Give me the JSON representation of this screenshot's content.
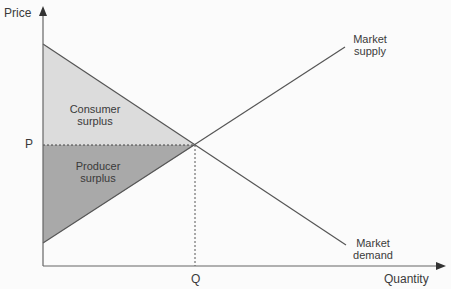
{
  "diagram": {
    "axes": {
      "y_label": "Price",
      "x_label": "Quantity"
    },
    "equilibrium": {
      "price_label": "P",
      "quantity_label": "Q"
    },
    "curves": {
      "supply": {
        "label_line1": "Market",
        "label_line2": "supply"
      },
      "demand": {
        "label_line1": "Market",
        "label_line2": "demand"
      }
    },
    "regions": {
      "consumer_surplus": {
        "label_line1": "Consumer",
        "label_line2": "surplus",
        "fill": "#dcdcdc"
      },
      "producer_surplus": {
        "label_line1": "Producer",
        "label_line2": "surplus",
        "fill": "#a9a9a9"
      }
    },
    "colors": {
      "background": "#fbfbfb",
      "line": "#555555",
      "axis": "#666666",
      "text": "#3a3a3a"
    }
  }
}
